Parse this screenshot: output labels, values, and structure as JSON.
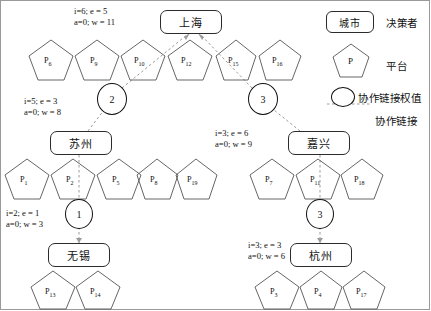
{
  "diagram": {
    "title_present": false,
    "cities": [
      {
        "id": "shanghai",
        "name": "上海",
        "x": 160,
        "y": 10,
        "w": 62,
        "h": 24
      },
      {
        "id": "suzhou",
        "name": "苏州",
        "x": 50,
        "y": 131,
        "w": 62,
        "h": 24
      },
      {
        "id": "jiaxing",
        "name": "嘉兴",
        "x": 288,
        "y": 131,
        "w": 62,
        "h": 24
      },
      {
        "id": "wuxi",
        "name": "无锡",
        "x": 48,
        "y": 243,
        "w": 62,
        "h": 24
      },
      {
        "id": "hangzhou",
        "name": "杭州",
        "x": 290,
        "y": 243,
        "w": 62,
        "h": 24
      }
    ],
    "annotations": [
      {
        "id": "ann-shanghai",
        "line1": "i=6;  e = 5",
        "line2": "a=0;  w = 11",
        "x": 74,
        "y": 6,
        "i": 6,
        "e": 5,
        "a": 0,
        "w": 11,
        "for": "shanghai"
      },
      {
        "id": "ann-suzhou",
        "line1": "i=5;  e = 3",
        "line2": "a=0;  w = 8",
        "x": 24,
        "y": 96,
        "i": 5,
        "e": 3,
        "a": 0,
        "w": 8,
        "for": "suzhou"
      },
      {
        "id": "ann-jiaxing",
        "line1": "i=3;  e = 6",
        "line2": "a=0;  w = 9",
        "x": 215,
        "y": 128,
        "i": 3,
        "e": 6,
        "a": 0,
        "w": 9,
        "for": "jiaxing"
      },
      {
        "id": "ann-wuxi",
        "line1": "i=2;  e = 1",
        "line2": "a=0;  w = 3",
        "x": 6,
        "y": 208,
        "i": 2,
        "e": 1,
        "a": 0,
        "w": 3,
        "for": "wuxi"
      },
      {
        "id": "ann-hangzhou",
        "line1": "i=3;  e = 3",
        "line2": "a=0;  w = 6",
        "x": 248,
        "y": 240,
        "i": 3,
        "e": 3,
        "a": 0,
        "w": 6,
        "for": "hangzhou"
      }
    ],
    "link_weights": [
      {
        "id": "weight-suzhou-shanghai",
        "value": "2",
        "cx": 112,
        "cy": 98,
        "r": 15
      },
      {
        "id": "weight-jiaxing-shanghai",
        "value": "3",
        "cx": 263,
        "cy": 98,
        "r": 15
      },
      {
        "id": "weight-wuxi-suzhou",
        "value": "1",
        "cx": 79,
        "cy": 213,
        "r": 14
      },
      {
        "id": "weight-hangzhou-jiaxing",
        "value": "3",
        "cx": 320,
        "cy": 213,
        "r": 14
      }
    ],
    "platform_rows": [
      {
        "row": "shanghai-row",
        "cy": 58,
        "platforms": [
          {
            "label": "P",
            "sub": "6",
            "cx": 51
          },
          {
            "label": "P",
            "sub": "9",
            "cx": 97
          },
          {
            "label": "P",
            "sub": "10",
            "cx": 143
          },
          {
            "label": "P",
            "sub": "12",
            "cx": 190
          },
          {
            "label": "P",
            "sub": "15",
            "cx": 236
          },
          {
            "label": "P",
            "sub": "16",
            "cx": 280
          }
        ]
      },
      {
        "row": "suzhou-row",
        "cy": 177,
        "platforms": [
          {
            "label": "P",
            "sub": "1",
            "cx": 27
          },
          {
            "label": "P",
            "sub": "2",
            "cx": 73
          },
          {
            "label": "P",
            "sub": "5",
            "cx": 119
          },
          {
            "label": "P",
            "sub": "8",
            "cx": 157
          },
          {
            "label": "P",
            "sub": "19",
            "cx": 196
          }
        ]
      },
      {
        "row": "jiaxing-row",
        "cy": 177,
        "platforms": [
          {
            "label": "P",
            "sub": "7",
            "cx": 272
          },
          {
            "label": "P",
            "sub": "11",
            "cx": 318
          },
          {
            "label": "P",
            "sub": "18",
            "cx": 362
          }
        ]
      },
      {
        "row": "wuxi-row",
        "cy": 289,
        "platforms": [
          {
            "label": "P",
            "sub": "13",
            "cx": 53
          },
          {
            "label": "P",
            "sub": "14",
            "cx": 98
          }
        ]
      },
      {
        "row": "hangzhou-row",
        "cy": 289,
        "platforms": [
          {
            "label": "P",
            "sub": "3",
            "cx": 277
          },
          {
            "label": "P",
            "sub": "4",
            "cx": 321
          },
          {
            "label": "P",
            "sub": "17",
            "cx": 364
          }
        ]
      }
    ]
  },
  "legend": {
    "city_box_label": "城市",
    "city_box_text": "决策者",
    "platform_glyph": "P",
    "platform_text": "平台",
    "weight_text": "协作链接权值",
    "link_text": "协作链接"
  }
}
